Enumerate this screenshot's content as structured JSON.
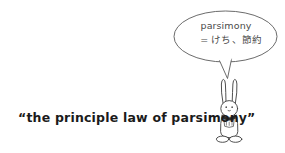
{
  "canvas": {
    "width": 285,
    "height": 153,
    "background_color": "#ffffff",
    "ink_color": "#3c3c3c",
    "caption_color": "#1b1b1b"
  },
  "speech_bubble": {
    "shape": "ellipse",
    "line_1": "parsimony",
    "line_2": "= けち、節約",
    "tail": "pointer-down-to-character"
  },
  "caption": {
    "text": "“the principle law of parsimony”"
  },
  "character": {
    "name": "rabbit",
    "parts": [
      "left-ear",
      "right-ear",
      "head",
      "left-eye",
      "right-eye",
      "nose",
      "collar",
      "chest-patch",
      "body",
      "left-foot",
      "right-foot"
    ]
  }
}
